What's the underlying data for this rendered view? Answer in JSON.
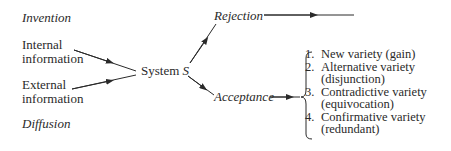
{
  "diagram": {
    "left_labels": {
      "invention": "Invention",
      "internal": [
        "Internal",
        "information"
      ],
      "external": [
        "External",
        "information"
      ],
      "diffusion": "Diffusion"
    },
    "center": {
      "system_label": "System",
      "system_var": "S"
    },
    "branches": {
      "rejection": "Rejection",
      "acceptance": "Acceptance"
    },
    "outcomes": [
      {
        "num": "1.",
        "lines": [
          "New variety (gain)"
        ]
      },
      {
        "num": "2.",
        "lines": [
          "Alternative variety",
          "(disjunction)"
        ]
      },
      {
        "num": "3.",
        "lines": [
          "Contradictive variety",
          "(equivocation)"
        ]
      },
      {
        "num": "4.",
        "lines": [
          "Confirmative variety",
          "(redundant)"
        ]
      }
    ],
    "line_color": "#2a2a2a"
  }
}
